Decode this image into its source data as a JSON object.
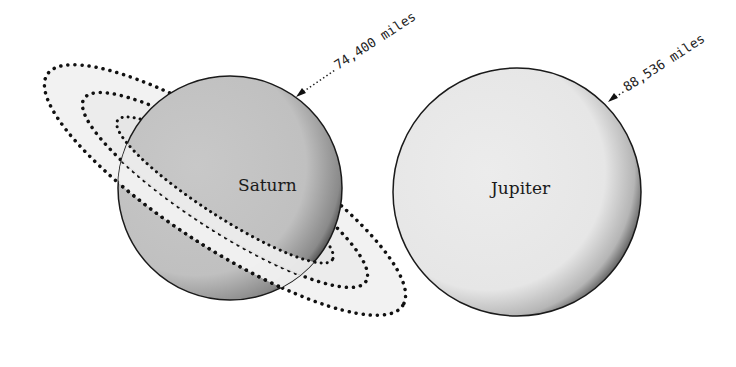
{
  "diagram": {
    "type": "planet-size-comparison",
    "planets": [
      {
        "name": "Saturn",
        "diameter_label": "74,400 miles",
        "body_color": "#c4c4c4",
        "has_rings": true
      },
      {
        "name": "Jupiter",
        "diameter_label": "88,536 miles",
        "body_color": "#e8e8e8",
        "has_rings": false
      }
    ],
    "colors": {
      "background": "#ffffff",
      "outline": "#1a1a1a",
      "ring_fill": "#efefef",
      "shadow": "#555555"
    }
  }
}
